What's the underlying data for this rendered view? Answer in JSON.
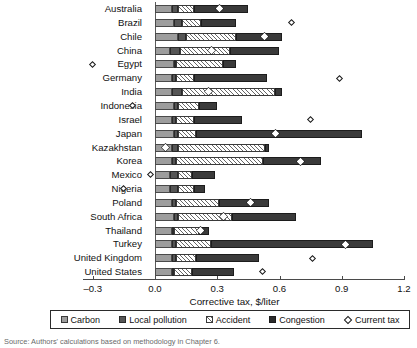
{
  "chart_data": {
    "type": "bar",
    "orientation": "horizontal",
    "stacked": true,
    "title": "",
    "xlabel": "Corrective tax, $/liter",
    "ylabel": "",
    "xlim": [
      -0.3,
      1.2
    ],
    "xticks": [
      "-0.3",
      "0.0",
      "0.3",
      "0.6",
      "0.9",
      "1.2"
    ],
    "xtick_values": [
      -0.3,
      0.0,
      0.3,
      0.6,
      0.9,
      1.2
    ],
    "grid": false,
    "legend_position": "bottom",
    "categories": [
      "Australia",
      "Brazil",
      "Chile",
      "China",
      "Egypt",
      "Germany",
      "India",
      "Indonesia",
      "Israel",
      "Japan",
      "Kazakhstan",
      "Korea",
      "Mexico",
      "Nigeria",
      "Poland",
      "South Africa",
      "Thailand",
      "Turkey",
      "United Kingdom",
      "United States"
    ],
    "series": [
      {
        "name": "Carbon",
        "color": "#9d9d9d",
        "values": [
          0.08,
          0.09,
          0.11,
          0.07,
          0.09,
          0.08,
          0.08,
          0.09,
          0.08,
          0.09,
          0.08,
          0.08,
          0.07,
          0.07,
          0.08,
          0.09,
          0.08,
          0.08,
          0.08,
          0.08
        ]
      },
      {
        "name": "Local pollution",
        "color": "#555555",
        "values": [
          0.03,
          0.04,
          0.04,
          0.05,
          0.01,
          0.02,
          0.05,
          0.02,
          0.02,
          0.02,
          0.03,
          0.02,
          0.04,
          0.04,
          0.02,
          0.02,
          0.01,
          0.02,
          0.02,
          0.01
        ]
      },
      {
        "name": "Accident",
        "color": "#ffffff",
        "values": [
          0.08,
          0.09,
          0.24,
          0.24,
          0.23,
          0.09,
          0.45,
          0.1,
          0.09,
          0.09,
          0.42,
          0.42,
          0.07,
          0.08,
          0.21,
          0.26,
          0.12,
          0.17,
          0.1,
          0.09
        ]
      },
      {
        "name": "Congestion",
        "color": "#3a3a3a",
        "values": [
          0.26,
          0.17,
          0.22,
          0.24,
          0.06,
          0.35,
          0.03,
          0.09,
          0.23,
          0.8,
          0.02,
          0.28,
          0.11,
          0.05,
          0.24,
          0.31,
          0.05,
          0.78,
          0.3,
          0.2
        ]
      }
    ],
    "current_tax": {
      "name": "Current tax",
      "marker": "diamond",
      "values": [
        0.31,
        0.66,
        0.53,
        0.27,
        -0.3,
        0.89,
        0.26,
        -0.11,
        0.75,
        0.58,
        0.05,
        0.7,
        -0.02,
        -0.15,
        0.46,
        0.33,
        0.22,
        0.92,
        0.76,
        0.52
      ]
    },
    "totals": [
      0.45,
      0.39,
      0.61,
      0.6,
      0.39,
      0.54,
      0.61,
      0.3,
      0.42,
      1.0,
      0.55,
      0.8,
      0.29,
      0.24,
      0.55,
      0.68,
      0.26,
      1.05,
      0.5,
      0.38
    ]
  },
  "axis": {
    "x_title": "Corrective tax, $/liter",
    "ticks": [
      "-0.3",
      "0.0",
      "0.3",
      "0.6",
      "0.9",
      "1.2"
    ]
  },
  "legend": {
    "items": [
      {
        "label": "Carbon",
        "swatch": "carbon-swatch"
      },
      {
        "label": "Local pollution",
        "swatch": "local-pollution-swatch"
      },
      {
        "label": "Accident",
        "swatch": "accident-swatch"
      },
      {
        "label": "Congestion",
        "swatch": "congestion-swatch"
      },
      {
        "label": "Current tax",
        "swatch": "current-tax-diamond-marker"
      }
    ]
  },
  "footer": {
    "source": "Source: Authors' calculations based on methodology in Chapter 6."
  }
}
